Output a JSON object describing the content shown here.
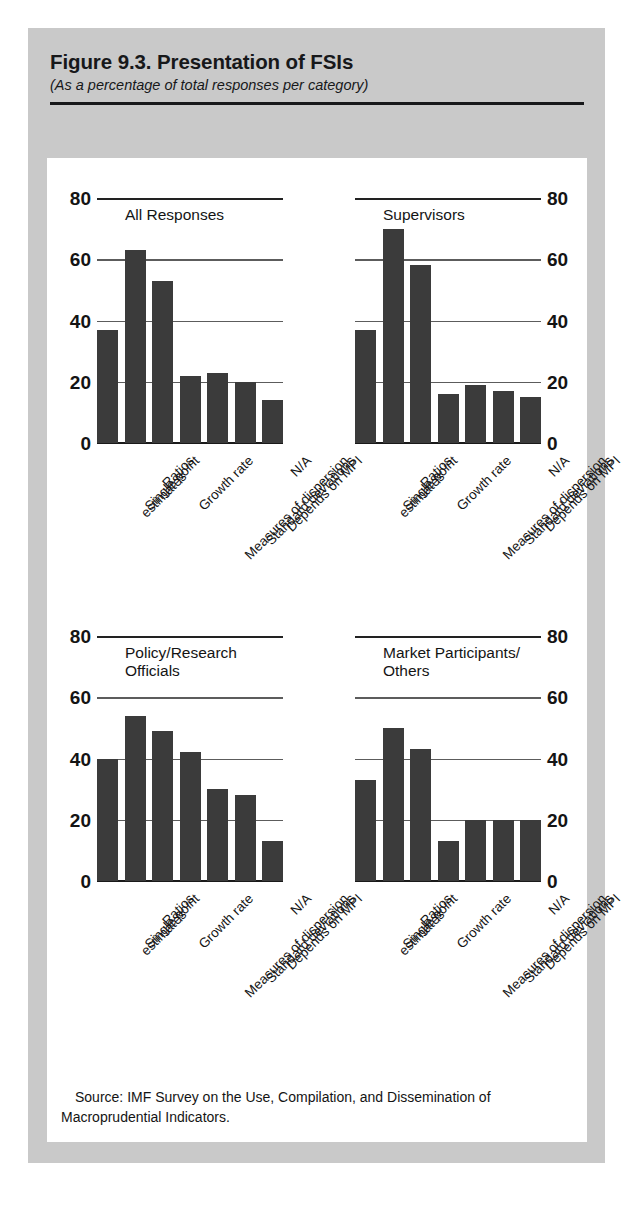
{
  "figure": {
    "title": "Figure 9.3.  Presentation of FSIs",
    "subtitle": "(As a percentage of total responses per category)",
    "source_note": "Source: IMF Survey on the Use, Compilation, and Dissemination of Macroprudential Indicators.",
    "bar_color": "#3b3b3b",
    "card_background": "#ffffff",
    "figure_background": "#c9c9c9"
  },
  "axis": {
    "ticks": [
      "80",
      "60",
      "40",
      "20",
      "0"
    ],
    "tick_values": [
      80,
      60,
      40,
      20,
      0
    ]
  },
  "categories": [
    "Single point\nestimates",
    "Ratios",
    "Growth rate",
    "Measures of dispersion",
    "Standard deviations",
    "Depends on MPI",
    "N/A"
  ],
  "category_labels": [
    "Single point estimates",
    "Ratios",
    "Growth rate",
    "Measures of dispersion",
    "Standard deviations",
    "Depends on MPI",
    "N/A"
  ],
  "panels": [
    {
      "title": "All Responses",
      "values": [
        37,
        63,
        53,
        22,
        23,
        20,
        14
      ]
    },
    {
      "title": "Supervisors",
      "values": [
        37,
        70,
        58,
        16,
        19,
        17,
        15
      ]
    },
    {
      "title": "Policy/Research\nOfficials",
      "values": [
        40,
        54,
        49,
        42,
        30,
        28,
        13
      ]
    },
    {
      "title": "Market Participants/\nOthers",
      "values": [
        33,
        50,
        43,
        13,
        20,
        20,
        20
      ]
    }
  ],
  "chart_data": {
    "type": "bar",
    "title": "Figure 9.3.  Presentation of FSIs",
    "subtitle": "(As a percentage of total responses per category)",
    "xlabel": "",
    "ylabel": "Percentage of total responses per category",
    "ylim": [
      0,
      80
    ],
    "yticks": [
      0,
      20,
      40,
      60,
      80
    ],
    "grid": true,
    "legend_position": "none",
    "panel_layout": "2x2 small multiples",
    "categories": [
      "Single point estimates",
      "Ratios",
      "Growth rate",
      "Measures of dispersion",
      "Standard deviations",
      "Depends on MPI",
      "N/A"
    ],
    "series": [
      {
        "name": "All Responses",
        "values": [
          37,
          63,
          53,
          22,
          23,
          20,
          14
        ]
      },
      {
        "name": "Supervisors",
        "values": [
          37,
          70,
          58,
          16,
          19,
          17,
          15
        ]
      },
      {
        "name": "Policy/Research Officials",
        "values": [
          40,
          54,
          49,
          42,
          30,
          28,
          13
        ]
      },
      {
        "name": "Market Participants/Others",
        "values": [
          33,
          50,
          43,
          13,
          20,
          20,
          20
        ]
      }
    ],
    "annotations": [
      "Source: IMF Survey on the Use, Compilation, and Dissemination of Macroprudential Indicators."
    ]
  }
}
